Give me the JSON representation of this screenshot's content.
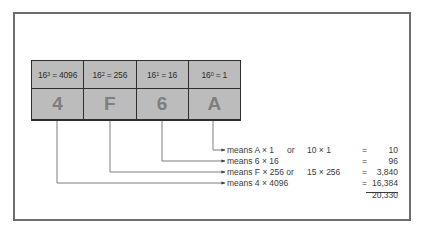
{
  "diagram": {
    "places": [
      {
        "base": "16",
        "exp": "3",
        "value": "= 4096",
        "digit": "4"
      },
      {
        "base": "16",
        "exp": "2",
        "value": "= 256",
        "digit": "F"
      },
      {
        "base": "16",
        "exp": "1",
        "value": "= 16",
        "digit": "6"
      },
      {
        "base": "16",
        "exp": "0",
        "value": "= 1",
        "digit": "A"
      }
    ],
    "explanations": [
      {
        "text": "means A × 1",
        "or": "or",
        "alt": "10 × 1",
        "eq": "=",
        "result": "10"
      },
      {
        "text": "means 6 × 16",
        "or": "",
        "alt": "",
        "eq": "=",
        "result": "96"
      },
      {
        "text": "means F × 256 or",
        "or": "",
        "alt": "15 × 256",
        "eq": "=",
        "result": "3,840"
      },
      {
        "text": "means 4 × 4096",
        "or": "",
        "alt": "",
        "eq": "=",
        "result": "16,384"
      }
    ],
    "total": "20,330",
    "colors": {
      "cell_fill": "#bcbcbc",
      "digit_text": "#7e7e7e",
      "border": "#2e2e2e",
      "frame": "#6e6e6e",
      "text": "#3a3a3a"
    }
  }
}
